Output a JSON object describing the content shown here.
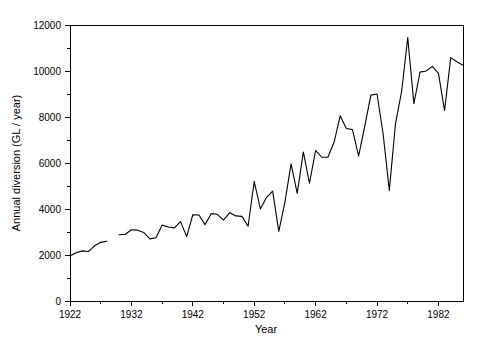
{
  "chart_data": {
    "type": "line",
    "title": "",
    "xlabel": "Year",
    "ylabel": "Annual diversion (GL / year)",
    "xlim": [
      1922,
      1986
    ],
    "ylim": [
      0,
      12000
    ],
    "grid": false,
    "legend": "none",
    "x_ticks": [
      1922,
      1932,
      1942,
      1952,
      1962,
      1972,
      1982
    ],
    "x_tick_labels": [
      "1922",
      "1932",
      "1942",
      "1952",
      "1962",
      "1972",
      "1982"
    ],
    "x_minor_tick_interval": 5,
    "y_ticks": [
      0,
      2000,
      4000,
      6000,
      8000,
      10000,
      12000
    ],
    "y_tick_labels": [
      "0",
      "2000",
      "4000",
      "6000",
      "8000",
      "10000",
      "12000"
    ],
    "y_minor_tick_interval": 1000,
    "line_color": "#000000",
    "series": [
      {
        "name": "Annual diversion",
        "segments": [
          {
            "x": [
              1922,
              1923,
              1924,
              1925,
              1926,
              1927,
              1928
            ],
            "values": [
              1960,
              2100,
              2180,
              2150,
              2400,
              2550,
              2600
            ]
          },
          {
            "x": [
              1930,
              1931,
              1932,
              1933,
              1934,
              1935,
              1936,
              1937,
              1938,
              1939,
              1940,
              1941,
              1942,
              1943,
              1944,
              1945,
              1946,
              1947,
              1948,
              1949,
              1950,
              1951,
              1952,
              1953,
              1954,
              1955,
              1956,
              1957,
              1958,
              1959,
              1960,
              1961,
              1962,
              1963,
              1964,
              1965,
              1966,
              1967,
              1968,
              1969,
              1970,
              1971,
              1972,
              1973,
              1974,
              1975,
              1976,
              1977,
              1978,
              1979,
              1980,
              1981,
              1982,
              1983,
              1984,
              1985,
              1986
            ],
            "values": [
              2880,
              2900,
              3100,
              3080,
              2980,
              2700,
              2750,
              3300,
              3220,
              3180,
              3450,
              2800,
              3750,
              3740,
              3320,
              3800,
              3770,
              3520,
              3840,
              3700,
              3680,
              3250,
              5200,
              4000,
              4500,
              4780,
              3030,
              4300,
              5960,
              4680,
              6480,
              5120,
              6550,
              6250,
              6250,
              6900,
              8050,
              7500,
              7450,
              6300,
              7600,
              8950,
              9000,
              7250,
              4800,
              7700,
              9100,
              11450,
              8580,
              9950,
              10000,
              10200,
              9900,
              8280,
              10580,
              10400,
              10250
            ]
          }
        ]
      }
    ]
  },
  "plot_geometry": {
    "left": 70,
    "right": 463,
    "top": 25,
    "bottom": 301
  },
  "axis_labels": {
    "y_axis_title": "Annual diversion (GL / year)",
    "x_axis_title": "Year"
  }
}
